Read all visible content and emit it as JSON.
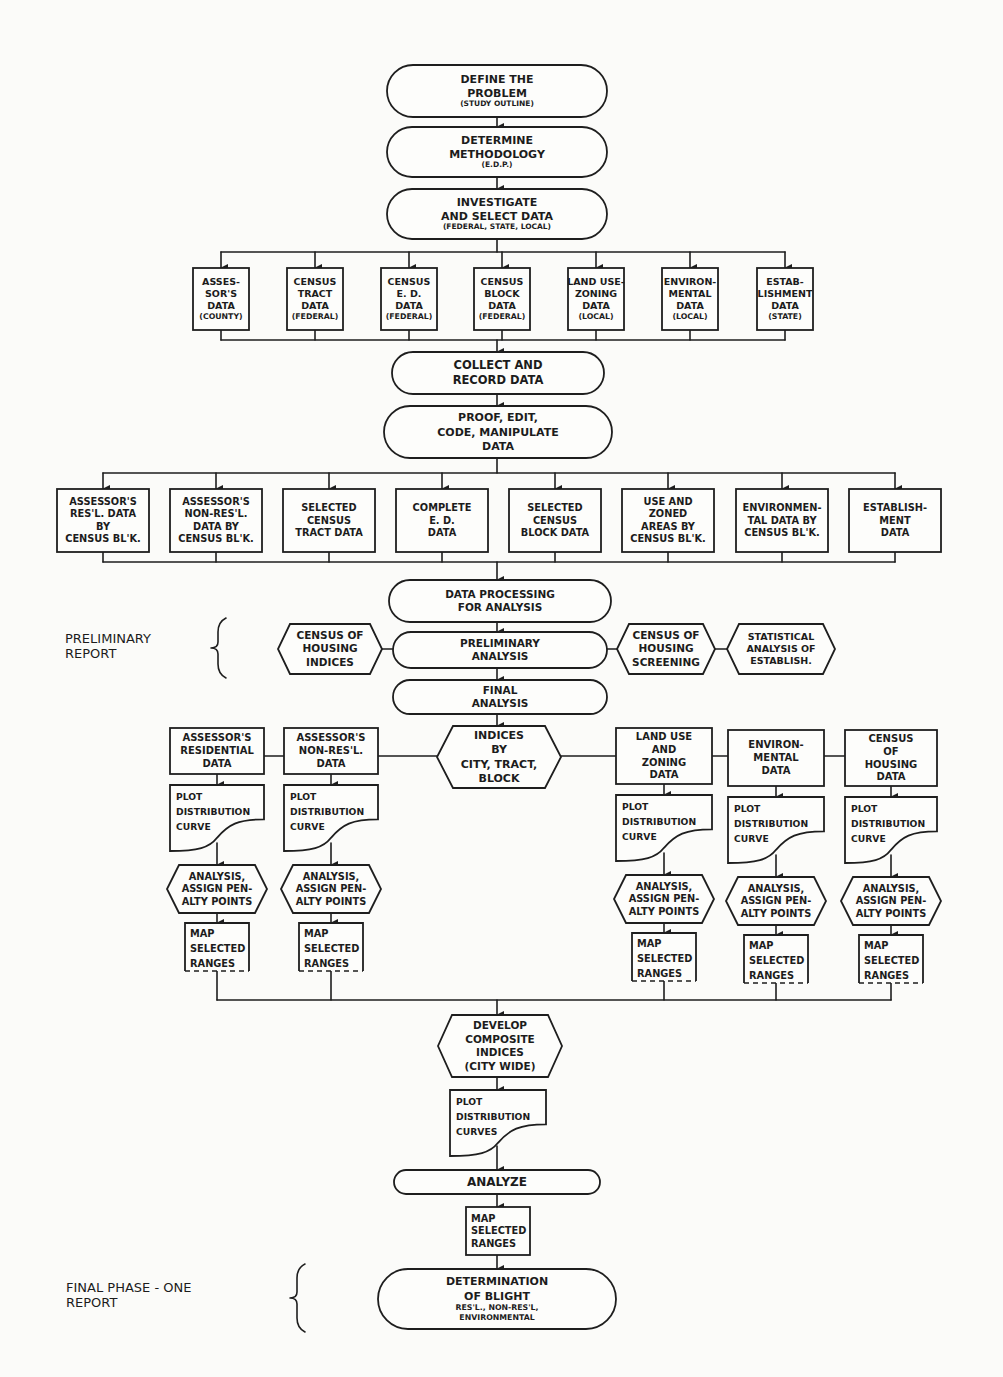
{
  "diagram": {
    "side_labels": {
      "preliminary": [
        "PRELIMINARY",
        "REPORT"
      ],
      "final": [
        "FINAL PHASE - ONE",
        "REPORT"
      ]
    },
    "main_flow": {
      "define": [
        "DEFINE THE",
        "PROBLEM",
        "(STUDY OUTLINE)"
      ],
      "methodology": [
        "DETERMINE",
        "METHODOLOGY",
        "(E.D.P.)"
      ],
      "investigate": [
        "INVESTIGATE",
        "AND SELECT DATA",
        "(FEDERAL, STATE, LOCAL)"
      ],
      "collect": [
        "COLLECT AND",
        "RECORD DATA"
      ],
      "proof": [
        "PROOF, EDIT,",
        "CODE, MANIPULATE",
        "DATA"
      ],
      "processing": [
        "DATA PROCESSING",
        "FOR ANALYSIS"
      ],
      "preliminary": [
        "PRELIMINARY",
        "ANALYSIS"
      ],
      "final": [
        "FINAL",
        "ANALYSIS"
      ],
      "composite": [
        "DEVELOP",
        "COMPOSITE",
        "INDICES",
        "(CITY WIDE)"
      ],
      "plot_curves": [
        "PLOT",
        "DISTRIBUTION",
        "CURVES"
      ],
      "analyze": [
        "ANALYZE"
      ],
      "map_final": [
        "MAP",
        "SELECTED",
        "RANGES"
      ],
      "blight": [
        "DETERMINATION",
        "OF BLIGHT",
        "RES'L., NON-RES'L,",
        "ENVIRONMENTAL"
      ]
    },
    "data_sources": [
      [
        "ASSES-",
        "SOR'S",
        "DATA",
        "(COUNTY)"
      ],
      [
        "CENSUS",
        "TRACT",
        "DATA",
        "(FEDERAL)"
      ],
      [
        "CENSUS",
        "E. D.",
        "DATA",
        "(FEDERAL)"
      ],
      [
        "CENSUS",
        "BLOCK",
        "DATA",
        "(FEDERAL)"
      ],
      [
        "LAND USE-",
        "ZONING",
        "DATA",
        "(LOCAL)"
      ],
      [
        "ENVIRON-",
        "MENTAL",
        "DATA",
        "(LOCAL)"
      ],
      [
        "ESTAB-",
        "LISHMENT",
        "DATA",
        "(STATE)"
      ]
    ],
    "processed_data": [
      [
        "ASSESSOR'S",
        "RES'L. DATA",
        "BY",
        "CENSUS BL'K."
      ],
      [
        "ASSESSOR'S",
        "NON-RES'L.",
        "DATA BY",
        "CENSUS BL'K."
      ],
      [
        "SELECTED",
        "CENSUS",
        "TRACT DATA"
      ],
      [
        "COMPLETE",
        "E. D.",
        "DATA"
      ],
      [
        "SELECTED",
        "CENSUS",
        "BLOCK DATA"
      ],
      [
        "USE AND",
        "ZONED",
        "AREAS BY",
        "CENSUS BL'K."
      ],
      [
        "ENVIRONMEN-",
        "TAL DATA BY",
        "CENSUS BL'K."
      ],
      [
        "ESTABLISH-",
        "MENT",
        "DATA"
      ]
    ],
    "preliminary_side": {
      "left": [
        "CENSUS OF",
        "HOUSING",
        "INDICES"
      ],
      "right1": [
        "CENSUS OF",
        "HOUSING",
        "SCREENING"
      ],
      "right2": [
        "STATISTICAL",
        "ANALYSIS OF",
        "ESTABLISH."
      ]
    },
    "indices_hub": [
      "INDICES",
      "BY",
      "CITY, TRACT,",
      "BLOCK"
    ],
    "analysis_columns": [
      {
        "header": [
          "ASSESSOR'S",
          "RESIDENTIAL",
          "DATA"
        ]
      },
      {
        "header": [
          "ASSESSOR'S",
          "NON-RES'L.",
          "DATA"
        ]
      },
      {
        "header": [
          "LAND USE",
          "AND",
          "ZONING",
          "DATA"
        ]
      },
      {
        "header": [
          "ENVIRON-",
          "MENTAL",
          "DATA"
        ]
      },
      {
        "header": [
          "CENSUS",
          "OF",
          "HOUSING",
          "DATA"
        ]
      }
    ],
    "column_steps": {
      "plot": [
        "PLOT",
        "DISTRIBUTION",
        "CURVE"
      ],
      "analysis": [
        "ANALYSIS,",
        "ASSIGN PEN-",
        "ALTY POINTS"
      ],
      "map": [
        "MAP",
        "SELECTED",
        "RANGES"
      ]
    }
  }
}
